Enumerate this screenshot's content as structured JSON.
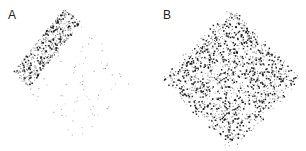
{
  "figure": {
    "panels": [
      {
        "label": "A",
        "description": "Sparse dot distribution concentrated along upper-left diagonal edge"
      },
      {
        "label": "B",
        "description": "Dense dot distribution filling a diamond-shaped region"
      }
    ],
    "colors": {
      "dots": "#111111",
      "background": "#ffffff"
    }
  }
}
